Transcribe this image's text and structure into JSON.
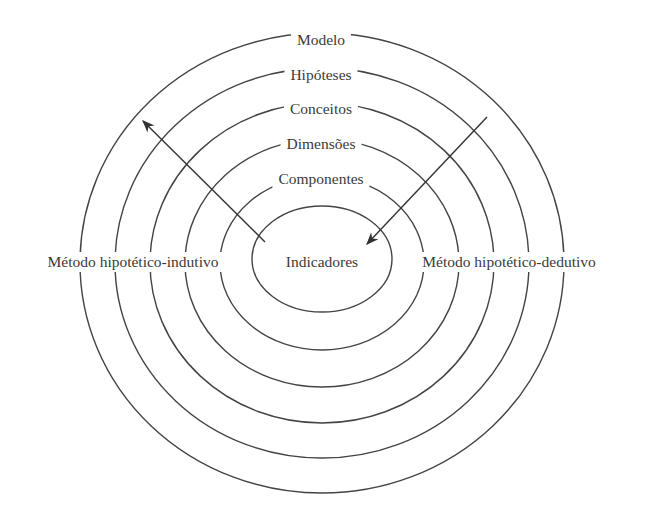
{
  "diagram": {
    "type": "concentric-levels",
    "levels": [
      {
        "label": "Modelo",
        "x": 321,
        "y": 40
      },
      {
        "label": "Hipóteses",
        "x": 321,
        "y": 75
      },
      {
        "label": "Conceitos",
        "x": 321,
        "y": 109
      },
      {
        "label": "Dimensões",
        "x": 321,
        "y": 144
      },
      {
        "label": "Componentes",
        "x": 321,
        "y": 179
      }
    ],
    "center": {
      "label": "Indicadores",
      "x": 322,
      "y": 262
    },
    "left_method": {
      "label": "Método hipotético-indutivo",
      "x": 133,
      "y": 262
    },
    "right_method": {
      "label": "Método hipotético-dedutivo",
      "x": 509,
      "y": 262
    },
    "arrows": [
      {
        "name": "inductive-arrow",
        "from": [
          265,
          242
        ],
        "to": [
          142,
          120
        ]
      },
      {
        "name": "deductive-arrow",
        "from": [
          487,
          117
        ],
        "to": [
          366,
          245
        ]
      }
    ],
    "line_color": "#444444",
    "text_color": "#3a3a3a"
  }
}
